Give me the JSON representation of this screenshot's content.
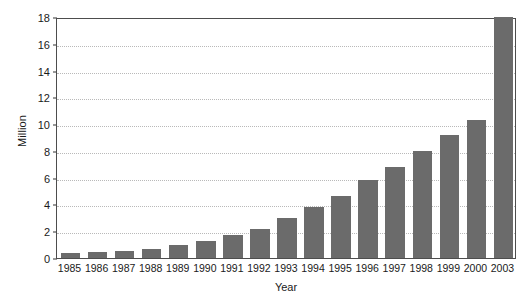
{
  "chart_data": {
    "type": "bar",
    "title": "",
    "xlabel": "Year",
    "ylabel": "Million",
    "categories": [
      "1985",
      "1986",
      "1987",
      "1988",
      "1989",
      "1990",
      "1991",
      "1992",
      "1993",
      "1994",
      "1995",
      "1996",
      "1997",
      "1998",
      "1999",
      "2000",
      "2003"
    ],
    "values": [
      0.4,
      0.45,
      0.5,
      0.7,
      0.95,
      1.3,
      1.75,
      2.2,
      3.0,
      3.8,
      4.6,
      5.8,
      6.8,
      8.0,
      9.2,
      10.3,
      18.0
    ],
    "ylim": [
      0,
      18
    ],
    "yticks": [
      0,
      2,
      4,
      6,
      8,
      10,
      12,
      14,
      16,
      18
    ],
    "ytick_labels": [
      "0",
      "2",
      "4",
      "6",
      "8",
      "10",
      "12",
      "14",
      "16",
      "18"
    ],
    "grid": true,
    "grid_axis": "y",
    "legend": false,
    "bar_color": "#6b6b6b",
    "gridline_color": "#b9b9b9",
    "frame_color": "#4d4d4d",
    "background": "#ffffff"
  }
}
